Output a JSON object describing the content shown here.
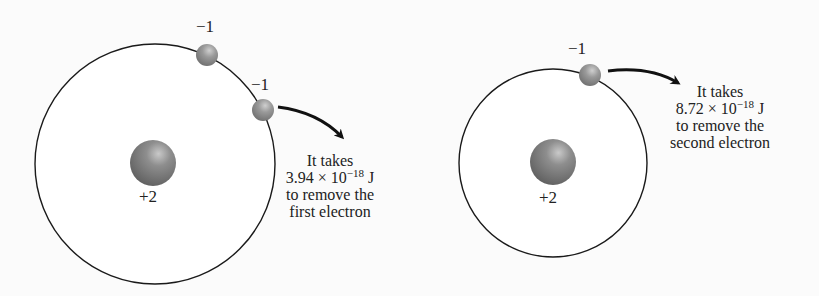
{
  "diagrams": [
    {
      "name": "helium-atom-first-ionization",
      "nucleus_charge": "+2",
      "electrons": [
        {
          "charge": "−1"
        },
        {
          "charge": "−1"
        }
      ],
      "note": {
        "line1": "It takes",
        "value_mantissa": "3.94 × 10",
        "value_exponent": "−18",
        "value_unit": " J",
        "line3": "to remove the",
        "line4": "first electron"
      }
    },
    {
      "name": "helium-ion-second-ionization",
      "nucleus_charge": "+2",
      "electrons": [
        {
          "charge": "−1"
        }
      ],
      "note": {
        "line1": "It takes",
        "value_mantissa": "8.72 × 10",
        "value_exponent": "−18",
        "value_unit": " J",
        "line3": "to remove the",
        "line4": "second electron"
      }
    }
  ],
  "colors": {
    "orbit": "#1a1a1a",
    "nucleus": "#7a7a7a",
    "electron": "#8f8f8f",
    "arrow": "#111111",
    "text": "#222222"
  }
}
